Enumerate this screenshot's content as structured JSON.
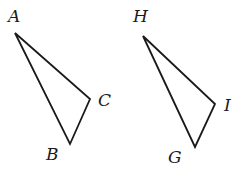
{
  "figure": {
    "triangles": [
      {
        "name": "ABC",
        "vertices": [
          {
            "label": "A",
            "x": 15,
            "y": 33,
            "label_x": 8,
            "label_y": 22
          },
          {
            "label": "C",
            "x": 90,
            "y": 99,
            "label_x": 98,
            "label_y": 106
          },
          {
            "label": "B",
            "x": 70,
            "y": 144,
            "label_x": 46,
            "label_y": 160
          }
        ]
      },
      {
        "name": "HIG",
        "vertices": [
          {
            "label": "H",
            "x": 143,
            "y": 36,
            "label_x": 133,
            "label_y": 22
          },
          {
            "label": "I",
            "x": 215,
            "y": 104,
            "label_x": 224,
            "label_y": 111
          },
          {
            "label": "G",
            "x": 195,
            "y": 147,
            "label_x": 168,
            "label_y": 163
          }
        ]
      }
    ],
    "colors": {
      "stroke": "#1a1a1a",
      "background": "#ffffff"
    }
  }
}
